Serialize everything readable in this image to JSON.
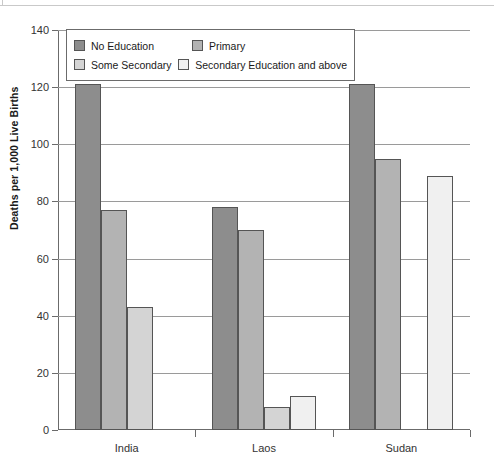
{
  "chart_data": {
    "type": "bar",
    "title": "",
    "xlabel": "",
    "ylabel": "Deaths per 1,000 Live Births",
    "ylim": [
      0,
      140
    ],
    "yticks": [
      0,
      20,
      40,
      60,
      80,
      100,
      120,
      140
    ],
    "grid": true,
    "legend_position": "top-left-inside",
    "categories": [
      "India",
      "Laos",
      "Sudan"
    ],
    "series": [
      {
        "name": "No Education",
        "color": "#8d8d8d",
        "values": [
          121,
          78,
          121
        ]
      },
      {
        "name": "Primary",
        "color": "#b3b3b3",
        "values": [
          77,
          70,
          95
        ]
      },
      {
        "name": "Some Secondary",
        "color": "#d4d4d4",
        "values": [
          43,
          8,
          0
        ]
      },
      {
        "name": "Secondary Education and above",
        "color": "#f0f0f0",
        "values": [
          0,
          12,
          89
        ]
      }
    ]
  },
  "axis": {
    "y_title": "Deaths per 1,000 Live Births",
    "y_tick_labels": [
      "0",
      "20",
      "40",
      "60",
      "80",
      "100",
      "120",
      "140"
    ],
    "x_tick_labels": [
      "India",
      "Laos",
      "Sudan"
    ]
  },
  "legend": {
    "items": [
      {
        "label": "No Education",
        "color": "#8d8d8d"
      },
      {
        "label": "Primary",
        "color": "#b3b3b3"
      },
      {
        "label": "Some Secondary",
        "color": "#d4d4d4"
      },
      {
        "label": "Secondary Education and above",
        "color": "#f0f0f0"
      }
    ]
  }
}
